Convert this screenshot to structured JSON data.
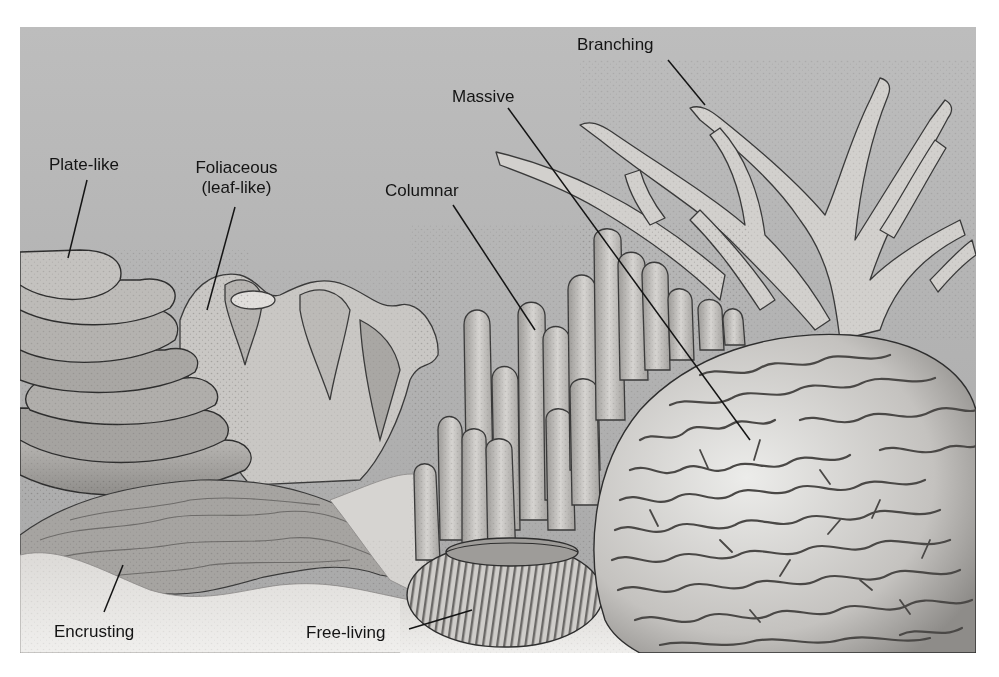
{
  "figure": {
    "colors": {
      "background_water": "#b3b3b3",
      "sand": "#e6e4e2",
      "coral_light": "#d8d6d3",
      "coral_mid": "#a9a7a4",
      "outline": "#2e2e2e",
      "label_text": "#141414"
    },
    "labels": [
      {
        "id": "plate-like",
        "text": "Plate-like"
      },
      {
        "id": "foliaceous",
        "text": "Foliaceous",
        "subtext": "(leaf-like)"
      },
      {
        "id": "columnar",
        "text": "Columnar"
      },
      {
        "id": "massive",
        "text": "Massive"
      },
      {
        "id": "branching",
        "text": "Branching"
      },
      {
        "id": "encrusting",
        "text": "Encrusting"
      },
      {
        "id": "free-living",
        "text": "Free-living"
      }
    ]
  }
}
